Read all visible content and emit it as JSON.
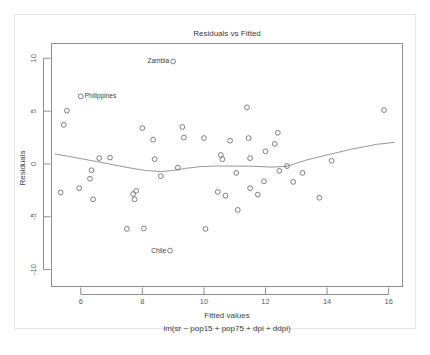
{
  "chart_data": {
    "type": "scatter",
    "title": "Residuals vs Fitted",
    "xlabel": "Fitted values",
    "sublabel": "lm(sr ~ pop15 + pop75 + dpi + ddpi)",
    "ylabel": "Residuals",
    "xlim": [
      5.05,
      16.45
    ],
    "ylim": [
      -11.6,
      11.4
    ],
    "xticks": [
      6,
      8,
      10,
      12,
      14,
      16
    ],
    "xtick_labels": [
      "6",
      "8",
      "10",
      "12",
      "14",
      "16"
    ],
    "yticks": [
      10,
      5,
      0,
      -5,
      -10
    ],
    "ytick_labels": [
      "10",
      "5",
      "0",
      "-5",
      "-10"
    ],
    "grid": false,
    "legend": "none",
    "marker_shape": "open-circle",
    "marker_color": "#6e6e7a",
    "smooth_color": "#8a8a92",
    "frame_color": "#8e8e8e",
    "points": [
      {
        "x": 5.55,
        "y": 5.05,
        "label": ""
      },
      {
        "x": 5.45,
        "y": 3.7,
        "label": ""
      },
      {
        "x": 5.35,
        "y": -2.7,
        "label": ""
      },
      {
        "x": 5.95,
        "y": -2.3,
        "label": ""
      },
      {
        "x": 6.0,
        "y": 6.4,
        "label": "Philippines"
      },
      {
        "x": 6.35,
        "y": -0.6,
        "label": ""
      },
      {
        "x": 6.3,
        "y": -1.4,
        "label": ""
      },
      {
        "x": 6.4,
        "y": -3.35,
        "label": ""
      },
      {
        "x": 6.6,
        "y": 0.55,
        "label": ""
      },
      {
        "x": 6.95,
        "y": 0.6,
        "label": ""
      },
      {
        "x": 7.5,
        "y": -6.15,
        "label": ""
      },
      {
        "x": 7.7,
        "y": -2.85,
        "label": ""
      },
      {
        "x": 7.8,
        "y": -2.55,
        "label": ""
      },
      {
        "x": 7.75,
        "y": -3.35,
        "label": ""
      },
      {
        "x": 8.05,
        "y": -6.1,
        "label": ""
      },
      {
        "x": 8.0,
        "y": 3.4,
        "label": ""
      },
      {
        "x": 8.35,
        "y": 2.3,
        "label": ""
      },
      {
        "x": 8.4,
        "y": 0.45,
        "label": ""
      },
      {
        "x": 8.6,
        "y": -1.15,
        "label": ""
      },
      {
        "x": 8.9,
        "y": -8.2,
        "label": "Chile"
      },
      {
        "x": 9.0,
        "y": 9.7,
        "label": "Zambia"
      },
      {
        "x": 9.15,
        "y": -0.35,
        "label": ""
      },
      {
        "x": 9.3,
        "y": 3.5,
        "label": ""
      },
      {
        "x": 9.35,
        "y": 2.5,
        "label": ""
      },
      {
        "x": 10.05,
        "y": -6.15,
        "label": ""
      },
      {
        "x": 10.0,
        "y": 2.45,
        "label": ""
      },
      {
        "x": 10.45,
        "y": -2.65,
        "label": ""
      },
      {
        "x": 10.55,
        "y": 0.85,
        "label": ""
      },
      {
        "x": 10.6,
        "y": 0.45,
        "label": ""
      },
      {
        "x": 10.7,
        "y": -3.0,
        "label": ""
      },
      {
        "x": 10.85,
        "y": 2.2,
        "label": ""
      },
      {
        "x": 11.05,
        "y": -0.85,
        "label": ""
      },
      {
        "x": 11.1,
        "y": -4.35,
        "label": ""
      },
      {
        "x": 11.4,
        "y": 5.35,
        "label": ""
      },
      {
        "x": 11.45,
        "y": 2.45,
        "label": ""
      },
      {
        "x": 11.5,
        "y": 0.55,
        "label": ""
      },
      {
        "x": 11.5,
        "y": -2.3,
        "label": ""
      },
      {
        "x": 11.75,
        "y": -2.9,
        "label": ""
      },
      {
        "x": 11.95,
        "y": -1.65,
        "label": ""
      },
      {
        "x": 12.0,
        "y": 1.2,
        "label": ""
      },
      {
        "x": 12.3,
        "y": 1.9,
        "label": ""
      },
      {
        "x": 12.4,
        "y": 2.95,
        "label": ""
      },
      {
        "x": 12.45,
        "y": -0.65,
        "label": ""
      },
      {
        "x": 12.7,
        "y": -0.2,
        "label": ""
      },
      {
        "x": 12.9,
        "y": -1.7,
        "label": ""
      },
      {
        "x": 13.2,
        "y": -0.85,
        "label": ""
      },
      {
        "x": 13.75,
        "y": -3.2,
        "label": ""
      },
      {
        "x": 14.15,
        "y": 0.3,
        "label": ""
      },
      {
        "x": 15.85,
        "y": 5.1,
        "label": ""
      }
    ],
    "smooth_curve": [
      {
        "x": 5.15,
        "y": 0.95
      },
      {
        "x": 5.6,
        "y": 0.72
      },
      {
        "x": 6.1,
        "y": 0.45
      },
      {
        "x": 6.6,
        "y": 0.18
      },
      {
        "x": 7.1,
        "y": -0.1
      },
      {
        "x": 7.6,
        "y": -0.38
      },
      {
        "x": 8.1,
        "y": -0.62
      },
      {
        "x": 8.6,
        "y": -0.72
      },
      {
        "x": 9.0,
        "y": -0.62
      },
      {
        "x": 9.4,
        "y": -0.42
      },
      {
        "x": 9.9,
        "y": -0.25
      },
      {
        "x": 10.4,
        "y": -0.2
      },
      {
        "x": 11.0,
        "y": -0.2
      },
      {
        "x": 11.6,
        "y": -0.22
      },
      {
        "x": 12.2,
        "y": -0.3
      },
      {
        "x": 12.7,
        "y": -0.22
      },
      {
        "x": 13.3,
        "y": 0.35
      },
      {
        "x": 14.0,
        "y": 0.85
      },
      {
        "x": 14.8,
        "y": 1.4
      },
      {
        "x": 15.6,
        "y": 1.85
      },
      {
        "x": 16.2,
        "y": 2.05
      }
    ]
  }
}
